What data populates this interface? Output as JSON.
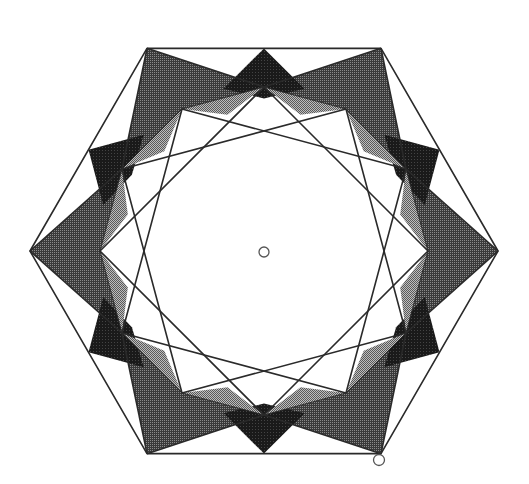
{
  "figure": {
    "type": "geometric-construction",
    "center": [
      264,
      251
    ],
    "hexagon_radius": 234,
    "dodecagon_radius": 164,
    "colors": {
      "stroke": "#2a2a2a",
      "dark": "#1e1e1e",
      "medium": "#555555",
      "light": "#9a9a9a",
      "background": "#ffffff"
    },
    "markers": [
      {
        "name": "center-point",
        "x": 264,
        "y": 252
      },
      {
        "name": "vertex-point",
        "x": 379,
        "y": 460
      }
    ]
  }
}
